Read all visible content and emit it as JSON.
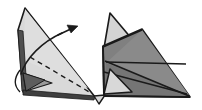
{
  "figure": {
    "type": "origami-fold-diagram",
    "background_color": "#ffffff",
    "outline_color": "#1a1a1a",
    "panel_count": 2,
    "captions": []
  },
  "palette": {
    "paper_light": "#d9d9d9",
    "paper_light_alt": "#cfcfcf",
    "paper_highlight": "#e3e3e3",
    "paper_mid": "#808080",
    "paper_mid_dark": "#6e6e6e",
    "paper_dark": "#5a5a5a",
    "paper_darkest": "#4a4a4a",
    "outline": "#1a1a1a",
    "fold_line": "#1a1a1a",
    "arrow": "#1a1a1a",
    "background": "#ffffff"
  },
  "left_panel": {
    "name": "before-fold",
    "label": "",
    "fill": "#d9d9d9",
    "body_points": "25,8 95,97 22,90 18,30",
    "spine_points": "18,30 22,90 26,90 23,31",
    "upper_face_points": "25,8 86,86 24,62",
    "flap_dark_points": "24,74 50,82 26,90",
    "flap_mid_points": "24,74 26,90 50,82",
    "bottom_edge_points": "24,90 95,97 93,100 24,94",
    "dashed_fold": {
      "name": "valley-fold-line",
      "style": "dashed",
      "points": "30,58 90,92",
      "dash_pattern": "5,4",
      "width": 1.3
    },
    "fold_arc": {
      "name": "fold-direction-arrow",
      "path": "M 22,76 C 30,60 48,42 66,33",
      "width": 1.4,
      "arrow_head": "66,33 56,31 62,39"
    },
    "arrow_tip_line": {
      "points": "60,36 76,28"
    }
  },
  "right_panel": {
    "name": "after-fold",
    "label": "",
    "fill": "#808080",
    "body_points": "142,30 190,97 104,96 103,47",
    "wing_top_points": "142,30 188,95 106,62",
    "left_tab_light_points": "110,14 136,44 104,47",
    "left_tab_shadow_points": "110,14 104,47 103,46",
    "lower_light_points": "110,70 131,92 104,94",
    "crease_points": "106,62 188,64",
    "lower_crease_points": "104,72 186,93",
    "tail_points": "95,97 104,96 100,103",
    "mid_shade_points": "142,30 190,97 106,64"
  },
  "annotations": {
    "step_number": "",
    "notes": []
  }
}
